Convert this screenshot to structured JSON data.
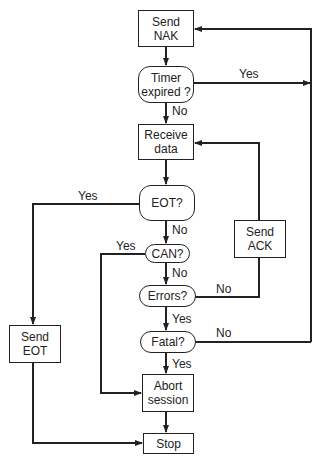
{
  "colors": {
    "line": "#222222",
    "background": "#ffffff"
  },
  "nodes": {
    "send_nak": {
      "line1": "Send",
      "line2": "NAK"
    },
    "timer": {
      "line1": "Timer",
      "line2": "expired ?"
    },
    "receive": {
      "line1": "Receive",
      "line2": "data"
    },
    "eot": {
      "label": "EOT?"
    },
    "send_ack": {
      "line1": "Send",
      "line2": "ACK"
    },
    "can": {
      "label": "CAN?"
    },
    "errors": {
      "label": "Errors?"
    },
    "fatal": {
      "label": "Fatal?"
    },
    "send_eot": {
      "line1": "Send",
      "line2": "EOT"
    },
    "abort": {
      "line1": "Abort",
      "line2": "session"
    },
    "stop": {
      "label": "Stop"
    }
  },
  "edge_labels": {
    "timer_yes": "Yes",
    "timer_no": "No",
    "eot_yes": "Yes",
    "eot_no": "No",
    "can_yes": "Yes",
    "can_no": "No",
    "errors_no": "No",
    "errors_yes": "Yes",
    "fatal_no": "No",
    "fatal_yes": "Yes"
  }
}
